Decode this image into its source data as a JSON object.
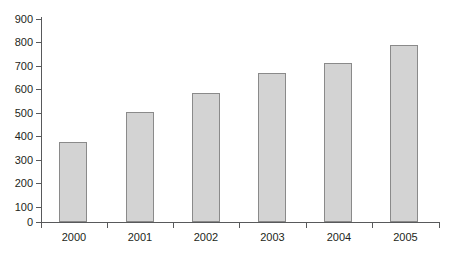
{
  "chart_data": {
    "type": "bar",
    "title": "",
    "subtitle": "",
    "xlabel": "",
    "ylabel": "",
    "categories": [
      "2000",
      "2001",
      "2002",
      "2003",
      "2004",
      "2005"
    ],
    "values": [
      355,
      487,
      573,
      663,
      705,
      787
    ],
    "series": [
      {
        "name": "",
        "values": [
          355,
          487,
          573,
          663,
          705,
          787
        ]
      }
    ],
    "ylim": [
      0,
      900
    ],
    "yticks": [
      0,
      100,
      200,
      300,
      400,
      500,
      600,
      700,
      800,
      900
    ],
    "ytick_labels": [
      "0",
      "100",
      "200",
      "300",
      "400",
      "500",
      "600",
      "700",
      "800",
      "900"
    ],
    "xtick_labels": [
      "2000",
      "2001",
      "2002",
      "2003",
      "2004",
      "2005"
    ],
    "grid": false,
    "legend": false,
    "legend_position": "none",
    "annotations": [],
    "colors": {
      "bar_fill": "#d3d3d3",
      "bar_border": "#8a8a8a",
      "axis": "#58595b",
      "text": "#231f20",
      "background": "#ffffff"
    }
  }
}
